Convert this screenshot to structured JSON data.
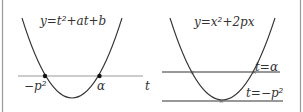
{
  "left_panel": {
    "equation": "y=t²+at+b",
    "root_left_label": "−p²",
    "root_right_label": "α",
    "axis_label": "t"
  },
  "right_panel": {
    "equation": "y=x²+2px",
    "line_upper_label": "t=α",
    "line_lower_label": "t=−p²"
  },
  "colors": {
    "curve": "#333333",
    "axis": "#999999",
    "border": "#999999"
  }
}
